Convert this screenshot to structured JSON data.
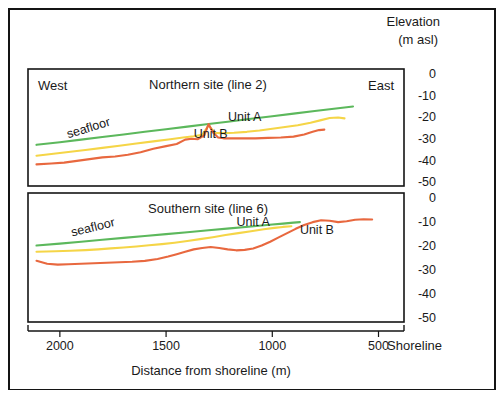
{
  "figure": {
    "elevation_header_line1": "Elevation",
    "elevation_header_line2": "(m asl)",
    "x_axis_title": "Distance from shoreline (m)",
    "shoreline_label": "Shoreline",
    "west_label": "West",
    "east_label": "East"
  },
  "chart_data": {
    "type": "line",
    "xlabel": "Distance from shoreline (m)",
    "ylabel": "Elevation (m asl)",
    "xlim": [
      2150,
      380
    ],
    "x_reversed": true,
    "xticks": [
      2000,
      1500,
      1000,
      500
    ],
    "xtick_labels": [
      "2000",
      "1500",
      "1000",
      "500"
    ],
    "yticks": [
      0,
      -10,
      -20,
      -30,
      -40,
      -50
    ],
    "ytick_labels": [
      "0",
      "-10",
      "-20",
      "-30",
      "-40",
      "-50"
    ],
    "ylim": [
      -52,
      2
    ],
    "grid": false,
    "legend_position": "inline-annotations",
    "colors": {
      "seafloor": "#5cb85c",
      "unit_a": "#f5d547",
      "unit_b": "#e8683f"
    },
    "panels": [
      {
        "id": "northern",
        "title": "Northern site (line 2)",
        "corner_left": "West",
        "corner_right": "East",
        "annotations": [
          {
            "text": "seafloor",
            "x": 1860,
            "y": -27,
            "rotate": -17
          },
          {
            "text": "Unit A",
            "x": 1130,
            "y": -22
          },
          {
            "text": "Unit B",
            "x": 1290,
            "y": -30
          }
        ],
        "series": [
          {
            "name": "seafloor",
            "color": "#5cb85c",
            "x": [
              2110,
              2000,
              1900,
              1800,
              1700,
              1600,
              1500,
              1400,
              1300,
              1200,
              1100,
              1000,
              900,
              800,
              700,
              620
            ],
            "y": [
              -33.0,
              -31.8,
              -30.6,
              -29.4,
              -28.2,
              -27.0,
              -25.8,
              -24.6,
              -23.4,
              -22.2,
              -21.0,
              -19.8,
              -18.6,
              -17.4,
              -16.2,
              -15.3
            ]
          },
          {
            "name": "unit_a",
            "color": "#f5d547",
            "x": [
              2110,
              2020,
              1950,
              1880,
              1800,
              1720,
              1640,
              1560,
              1480,
              1420,
              1370,
              1330,
              1300,
              1270,
              1230,
              1180,
              1120,
              1060,
              1000,
              940,
              880,
              820,
              770,
              730,
              690,
              660
            ],
            "y": [
              -38.0,
              -37.0,
              -36.2,
              -35.4,
              -34.4,
              -33.4,
              -32.4,
              -31.4,
              -30.4,
              -29.6,
              -29.0,
              -28.4,
              -24.0,
              -27.5,
              -27.6,
              -27.4,
              -27.0,
              -26.4,
              -25.6,
              -24.8,
              -24.0,
              -22.8,
              -21.6,
              -20.6,
              -20.4,
              -20.8
            ]
          },
          {
            "name": "unit_b",
            "color": "#e8683f",
            "x": [
              2110,
              2040,
              1980,
              1920,
              1860,
              1800,
              1740,
              1680,
              1620,
              1560,
              1500,
              1450,
              1410,
              1380,
              1350,
              1320,
              1300,
              1280,
              1255,
              1230,
              1190,
              1140,
              1080,
              1020,
              960,
              900,
              850,
              810,
              780,
              755
            ],
            "y": [
              -42.0,
              -41.6,
              -41.2,
              -40.4,
              -39.6,
              -38.8,
              -38.4,
              -37.6,
              -36.4,
              -34.8,
              -33.6,
              -32.6,
              -30.6,
              -30.2,
              -30.4,
              -28.6,
              -23.4,
              -27.2,
              -29.6,
              -30.0,
              -30.0,
              -30.0,
              -30.0,
              -29.8,
              -29.6,
              -29.2,
              -28.2,
              -27.0,
              -26.2,
              -26.0
            ]
          }
        ]
      },
      {
        "id": "southern",
        "title": "Southern site (line 6)",
        "corner_left": "",
        "corner_right": "",
        "annotations": [
          {
            "text": "seafloor",
            "x": 1840,
            "y": -14,
            "rotate": -14
          },
          {
            "text": "Unit A",
            "x": 1090,
            "y": -12
          },
          {
            "text": "Unit B",
            "x": 790,
            "y": -15
          }
        ],
        "series": [
          {
            "name": "seafloor",
            "color": "#5cb85c",
            "x": [
              2110,
              2000,
              1900,
              1800,
              1700,
              1600,
              1500,
              1400,
              1300,
              1200,
              1100,
              1000,
              950,
              900,
              870
            ],
            "y": [
              -20.0,
              -19.2,
              -18.4,
              -17.6,
              -16.8,
              -16.0,
              -15.2,
              -14.4,
              -13.6,
              -12.8,
              -12.0,
              -11.2,
              -10.8,
              -10.4,
              -10.2
            ]
          },
          {
            "name": "unit_a",
            "color": "#f5d547",
            "x": [
              2110,
              2020,
              1950,
              1880,
              1820,
              1760,
              1700,
              1640,
              1580,
              1520,
              1460,
              1400,
              1340,
              1280,
              1220,
              1160,
              1100,
              1040,
              990,
              950,
              910
            ],
            "y": [
              -22.6,
              -22.4,
              -22.2,
              -21.9,
              -21.6,
              -21.2,
              -20.8,
              -20.4,
              -19.9,
              -19.4,
              -18.8,
              -18.1,
              -17.3,
              -16.5,
              -15.6,
              -14.8,
              -14.0,
              -13.2,
              -12.6,
              -12.2,
              -11.9
            ]
          },
          {
            "name": "unit_b",
            "color": "#e8683f",
            "x": [
              2110,
              2060,
              2010,
              1960,
              1900,
              1840,
              1780,
              1720,
              1660,
              1600,
              1540,
              1490,
              1450,
              1410,
              1370,
              1330,
              1290,
              1250,
              1210,
              1170,
              1130,
              1090,
              1050,
              1010,
              970,
              930,
              890,
              850,
              810,
              770,
              730,
              690,
              650,
              610,
              570,
              530
            ],
            "y": [
              -26.4,
              -27.6,
              -28.0,
              -27.8,
              -27.6,
              -27.4,
              -27.2,
              -27.0,
              -26.8,
              -26.4,
              -25.6,
              -24.6,
              -23.6,
              -22.6,
              -21.6,
              -21.0,
              -20.6,
              -21.0,
              -21.6,
              -22.0,
              -21.8,
              -21.2,
              -20.0,
              -18.4,
              -16.6,
              -14.8,
              -13.0,
              -11.4,
              -10.2,
              -9.4,
              -9.6,
              -10.2,
              -9.8,
              -9.2,
              -9.0,
              -9.1
            ]
          }
        ]
      }
    ]
  }
}
